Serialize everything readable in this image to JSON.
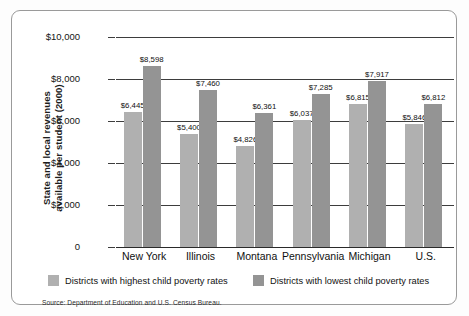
{
  "chart_data": {
    "type": "bar",
    "title": "",
    "subtitle": "",
    "xlabel": "",
    "ylabel": "State and local revenues available per student (2000)",
    "ylabel_lines": [
      "State and local revenues",
      "available per student (2000)"
    ],
    "categories": [
      "New York",
      "Illinois",
      "Montana",
      "Pennsylvania",
      "Michigan",
      "U.S."
    ],
    "series": [
      {
        "name": "Districts with highest child poverty rates",
        "color": "#b0b0b0",
        "values": [
          6445,
          5400,
          4826,
          6037,
          6815,
          5846
        ],
        "labels": [
          "$6,445",
          "$5,400",
          "$4,826",
          "$6,037",
          "$6,815",
          "$5,846"
        ]
      },
      {
        "name": "Districts with lowest child poverty rates",
        "color": "#949494",
        "values": [
          8598,
          7460,
          6361,
          7285,
          7917,
          6812
        ],
        "labels": [
          "$8,598",
          "$7,460",
          "$6,361",
          "$7,285",
          "$7,917",
          "$6,812"
        ]
      }
    ],
    "ylim": [
      0,
      10000
    ],
    "yticks": [
      0,
      2000,
      4000,
      6000,
      8000,
      10000
    ],
    "ytick_labels": [
      "0",
      "$2,000",
      "$4,000",
      "$6,000",
      "$8,000",
      "$10,000"
    ],
    "grid": true,
    "legend_position": "bottom"
  },
  "legend": {
    "items": [
      {
        "label": "Districts with highest child poverty rates",
        "color": "#b0b0b0"
      },
      {
        "label": "Districts with lowest child poverty rates",
        "color": "#949494"
      }
    ]
  },
  "source": {
    "text": "Source: Department of Education and U.S. Census Bureau."
  }
}
